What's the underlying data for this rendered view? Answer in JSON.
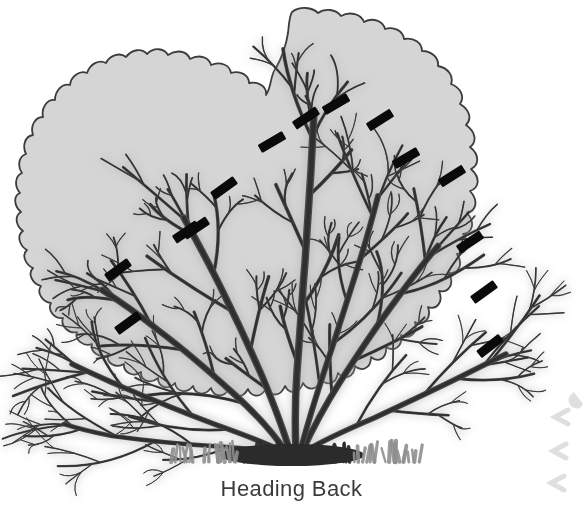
{
  "figure": {
    "caption": "Heading Back",
    "technique_label": "Heading Back"
  },
  "colors": {
    "background": "#ffffff",
    "foliage_fill": "#d5d5d5",
    "foliage_outline": "#3c3c3c",
    "branch_dark": "#2f2f2f",
    "branch_mid": "#4a4a4a",
    "branch_shadow": "#a9a9a9",
    "cut_mark": "#0a0a0a",
    "grass": "#8f8f8f",
    "grass_dark": "#2b2b2b",
    "caption_text": "#3b3b3b",
    "edge_hint": "#b9b9b9"
  },
  "canvas": {
    "width": 583,
    "height": 505
  },
  "foliage_outline_path": "M 292 12 C 300 6 312 7 318 13 C 325 8 336 9 341 16 C 350 11 361 14 364 22 C 373 17 383 21 385 29 C 394 26 403 31 404 39 C 414 37 422 43 422 51 C 432 51 439 58 438 66 C 448 68 454 76 451 84 C 461 88 465 97 460 104 C 470 110 472 119 466 125 C 476 132 477 142 470 147 C 480 155 479 165 471 169 C 481 178 479 188 470 191 C 479 201 476 211 467 213 C 476 223 472 233 463 234 C 471 245 466 254 457 254 C 464 265 458 274 449 273 C 455 285 448 293 439 291 C 444 303 436 310 428 307 C 432 319 423 326 415 322 C 418 334 409 340 401 335 C 403 347 394 352 386 347 C 387 359 378 363 371 357 C 371 369 361 372 355 366 C 354 378 344 380 338 373 C 336 385 326 386 321 379 C 318 391 308 391 303 383 C 299 395 289 394 285 386 C 280 398 270 396 266 388 C 261 399 251 397 248 389 C 242 400 232 397 229 389 C 223 399 213 396 211 388 C 204 397 195 394 193 386 C 186 395 176 391 175 383 C 168 391 158 387 158 378 C 150 385 140 380 141 372 C 133 378 123 372 124 364 C 116 369 106 363 108 355 C 100 359 90 352 92 344 C 84 347 74 340 77 332 C 69 334 60 326 63 318 C 55 319 47 311 51 303 C 43 302 36 293 41 286 C 33 284 27 274 33 268 C 26 265 21 255 27 250 C 20 246 16 236 23 231 C 16 226 14 216 21 212 C 14 206 13 196 20 193 C 14 186 15 176 22 173 C 17 166 19 156 26 154 C 22 146 25 136 33 135 C 30 126 35 117 43 117 C 41 108 47 99 55 100 C 55 91 62 83 70 85 C 71 76 80 70 87 73 C 90 64 99 59 106 63 C 110 55 120 52 126 57 C 132 49 142 48 147 54 C 154 47 164 48 168 55 C 177 49 187 51 190 59 C 199 54 209 57 211 65 C 220 61 230 65 231 73 C 240 70 249 75 249 83 C 259 81 267 87 266 95 C 272 86 270 75 276 68 C 281 59 286 46 288 33 C 289 25 289 17 292 12 Z",
  "branches": [
    {
      "name": "trunk-center",
      "d": "M 296 452 C 295 430 295 400 297 372 C 299 340 302 300 305 262 C 307 230 309 200 311 170 C 312 150 313 130 314 112",
      "w": 7.5
    },
    {
      "name": "trunk-center-left",
      "d": "M 290 452 C 283 428 272 400 262 376 C 248 344 232 310 218 282 C 206 258 194 236 184 218",
      "w": 7
    },
    {
      "name": "trunk-left-mid",
      "d": "M 286 452 C 274 434 254 412 234 394 C 210 372 182 348 158 330 C 138 314 118 300 102 290",
      "w": 6.5
    },
    {
      "name": "trunk-left-low",
      "d": "M 284 452 C 268 444 242 434 214 424 C 182 412 148 398 120 386 C 100 377 84 370 72 364",
      "w": 5.5
    },
    {
      "name": "trunk-right-mid",
      "d": "M 302 452 C 312 430 326 404 340 382 C 358 354 378 324 396 300 C 412 278 426 260 438 246",
      "w": 6.5
    },
    {
      "name": "trunk-right-steep",
      "d": "M 300 452 C 307 426 316 396 326 366 C 338 330 350 292 360 260 C 368 234 374 212 378 196",
      "w": 6
    },
    {
      "name": "trunk-right-low",
      "d": "M 304 452 C 320 442 346 430 374 418 C 404 404 434 390 458 378 C 478 368 494 360 506 354",
      "w": 5.5
    },
    {
      "name": "trunk-far-left",
      "d": "M 288 452 C 270 450 242 448 212 446 C 178 444 142 440 112 436 C 92 432 76 428 64 424",
      "w": 4.5
    }
  ],
  "cut_marks": [
    {
      "id": 1,
      "x": 196,
      "y": 228,
      "angle": -34
    },
    {
      "id": 2,
      "x": 224,
      "y": 188,
      "angle": -36
    },
    {
      "id": 3,
      "x": 272,
      "y": 142,
      "angle": -30
    },
    {
      "id": 4,
      "x": 306,
      "y": 118,
      "angle": -34
    },
    {
      "id": 5,
      "x": 336,
      "y": 104,
      "angle": -30
    },
    {
      "id": 6,
      "x": 380,
      "y": 120,
      "angle": -32
    },
    {
      "id": 7,
      "x": 406,
      "y": 158,
      "angle": -30
    },
    {
      "id": 8,
      "x": 452,
      "y": 176,
      "angle": -32
    },
    {
      "id": 9,
      "x": 470,
      "y": 242,
      "angle": -34
    },
    {
      "id": 10,
      "x": 484,
      "y": 292,
      "angle": -36
    },
    {
      "id": 11,
      "x": 490,
      "y": 346,
      "angle": -38
    },
    {
      "id": 12,
      "x": 186,
      "y": 232,
      "angle": -34
    },
    {
      "id": 13,
      "x": 118,
      "y": 270,
      "angle": -36
    },
    {
      "id": 14,
      "x": 128,
      "y": 323,
      "angle": -36
    }
  ],
  "grass_tufts": {
    "count": 18,
    "baseline_y": 462,
    "x_start": 172,
    "x_end": 412
  }
}
